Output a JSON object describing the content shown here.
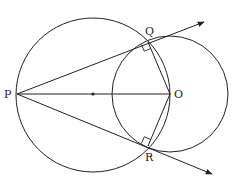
{
  "diagram": {
    "type": "geometry",
    "colors": {
      "stroke": "#222222",
      "background": "#ffffff"
    },
    "points": {
      "P": {
        "label": "P",
        "x": 17,
        "y": 94
      },
      "O": {
        "label": "O",
        "x": 170,
        "y": 94
      },
      "Q": {
        "label": "Q",
        "x": 148,
        "y": 42
      },
      "R": {
        "label": "R",
        "x": 148,
        "y": 146
      },
      "M": {
        "label": "",
        "x": 93,
        "y": 94
      }
    },
    "circles": [
      {
        "name": "circle-diameter-PO",
        "cx": 93,
        "cy": 96,
        "r": 76
      },
      {
        "name": "circle-center-O",
        "cx": 170,
        "cy": 94,
        "r": 58
      }
    ],
    "rays": [
      {
        "name": "ray-PQ",
        "from": "P",
        "to_x": 204,
        "to_y": 22
      },
      {
        "name": "ray-PR",
        "from": "P",
        "to_x": 212,
        "to_y": 174
      }
    ],
    "segments": [
      "PO",
      "OQ",
      "OR"
    ],
    "right_angles": [
      "Q",
      "R"
    ],
    "labels": {
      "P": "P",
      "Q": "Q",
      "R": "R",
      "O": "O"
    }
  }
}
